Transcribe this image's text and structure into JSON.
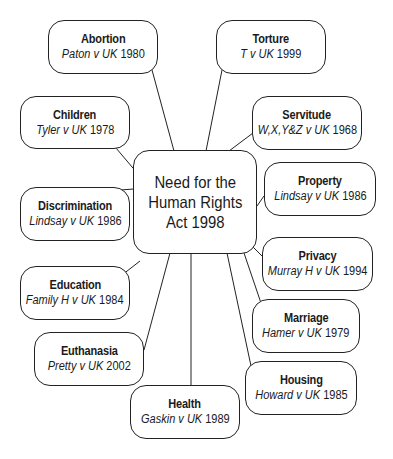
{
  "diagram": {
    "center": {
      "text": "Need for the\nHuman Rights\nAct 1998"
    },
    "nodes": [
      {
        "id": "abortion",
        "title": "Abortion",
        "case_name": "Paton v UK",
        "year": "1980"
      },
      {
        "id": "torture",
        "title": "Torture",
        "case_name": "T v UK",
        "year": "1999"
      },
      {
        "id": "children",
        "title": "Children",
        "case_name": "Tyler v UK",
        "year": "1978"
      },
      {
        "id": "servitude",
        "title": "Servitude",
        "case_name": "W,X,Y&Z v UK",
        "year": "1968"
      },
      {
        "id": "discrimination",
        "title": "Discrimination",
        "case_name": "Lindsay v UK",
        "year": "1986"
      },
      {
        "id": "property",
        "title": "Property",
        "case_name": "Lindsay v UK",
        "year": "1986"
      },
      {
        "id": "privacy",
        "title": "Privacy",
        "case_name": "Murray H v UK",
        "year": "1994"
      },
      {
        "id": "education",
        "title": "Education",
        "case_name": "Family H v UK",
        "year": "1984"
      },
      {
        "id": "marriage",
        "title": "Marriage",
        "case_name": "Hamer v UK",
        "year": "1979"
      },
      {
        "id": "euthanasia",
        "title": "Euthanasia",
        "case_name": "Pretty v UK",
        "year": "2002"
      },
      {
        "id": "housing",
        "title": "Housing",
        "case_name": "Howard v UK",
        "year": "1985"
      },
      {
        "id": "health",
        "title": "Health",
        "case_name": "Gaskin v UK",
        "year": "1989"
      }
    ]
  }
}
